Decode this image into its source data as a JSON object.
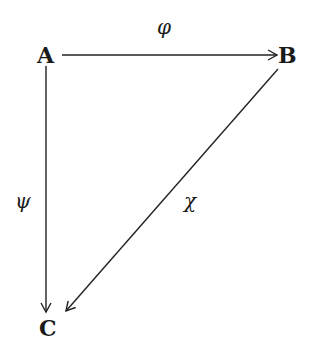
{
  "diagram": {
    "type": "commutative-triangle",
    "nodes": {
      "A": {
        "label": "A"
      },
      "B": {
        "label": "B"
      },
      "C": {
        "label": "C"
      }
    },
    "edges": {
      "phi": {
        "from": "A",
        "to": "B",
        "label": "φ"
      },
      "psi": {
        "from": "A",
        "to": "C",
        "label": "ψ"
      },
      "chi": {
        "from": "B",
        "to": "C",
        "label": "χ"
      }
    }
  }
}
